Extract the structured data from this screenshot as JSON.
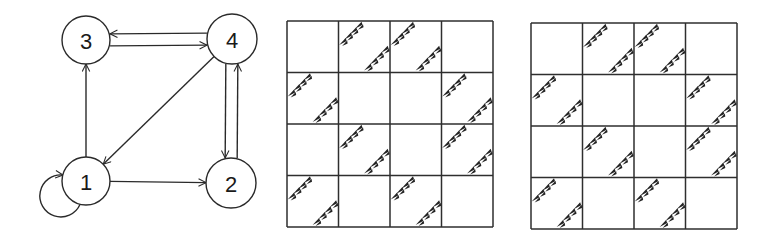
{
  "graph": {
    "nodes": [
      {
        "id": "1",
        "label": "1",
        "cx": 86,
        "cy": 181,
        "r": 24
      },
      {
        "id": "2",
        "label": "2",
        "cx": 231,
        "cy": 183,
        "r": 25
      },
      {
        "id": "3",
        "label": "3",
        "cx": 86,
        "cy": 40,
        "r": 24
      },
      {
        "id": "4",
        "label": "4",
        "cx": 232,
        "cy": 39,
        "r": 25
      }
    ],
    "edges": [
      {
        "from": "1",
        "to": "1",
        "type": "self-loop"
      },
      {
        "from": "1",
        "to": "2"
      },
      {
        "from": "1",
        "to": "3"
      },
      {
        "from": "3",
        "to": "4"
      },
      {
        "from": "4",
        "to": "3"
      },
      {
        "from": "4",
        "to": "1"
      },
      {
        "from": "4",
        "to": "2"
      },
      {
        "from": "2",
        "to": "4"
      }
    ]
  },
  "matrices": [
    {
      "name": "adjacency-matrix-a",
      "x": 287,
      "y": 21,
      "size": 206,
      "rows": 4,
      "cols": 4,
      "cells": [
        [
          0,
          1,
          1,
          0
        ],
        [
          1,
          0,
          0,
          1
        ],
        [
          0,
          1,
          0,
          1
        ],
        [
          1,
          0,
          1,
          0
        ]
      ]
    },
    {
      "name": "adjacency-matrix-b",
      "x": 531,
      "y": 23,
      "size": 206,
      "rows": 4,
      "cols": 4,
      "cells": [
        [
          0,
          1,
          1,
          0
        ],
        [
          1,
          0,
          0,
          1
        ],
        [
          0,
          1,
          0,
          1
        ],
        [
          1,
          0,
          1,
          0
        ]
      ]
    }
  ],
  "colors": {
    "ink": "#2a2a2a",
    "background": "#ffffff"
  }
}
